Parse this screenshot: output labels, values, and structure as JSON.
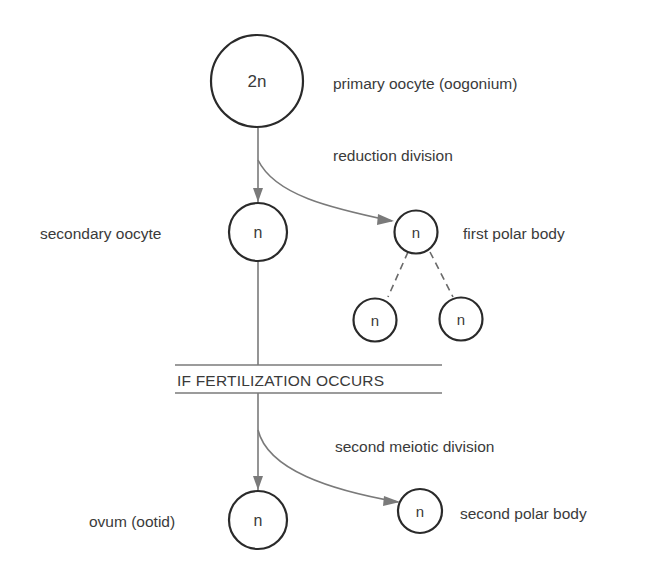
{
  "diagram": {
    "type": "flow",
    "colors": {
      "circle_stroke": "#2a2a2a",
      "connector": "#7a7a7a",
      "text": "#3a3a3a",
      "background": "#ffffff"
    },
    "nodes": {
      "primary": {
        "ploidy": "2n",
        "label": "primary oocyte (oogonium)"
      },
      "secondary": {
        "ploidy": "n",
        "label": "secondary oocyte"
      },
      "first_polar": {
        "ploidy": "n",
        "label": "first polar body"
      },
      "first_polar_child_left": {
        "ploidy": "n"
      },
      "first_polar_child_right": {
        "ploidy": "n"
      },
      "ovum": {
        "ploidy": "n",
        "label": "ovum (ootid)"
      },
      "second_polar": {
        "ploidy": "n",
        "label": "second polar body"
      }
    },
    "edges": {
      "reduction_division": "reduction division",
      "second_meiotic_division": "second meiotic division"
    },
    "condition_banner": "IF FERTILIZATION OCCURS"
  }
}
